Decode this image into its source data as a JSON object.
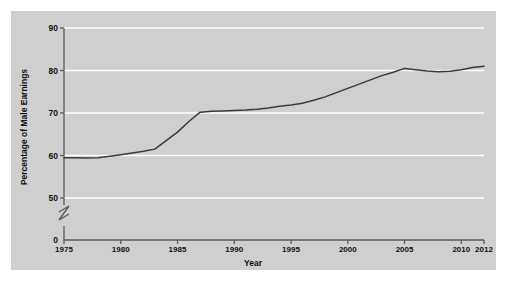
{
  "chart_data": {
    "type": "line",
    "title": "",
    "xlabel": "Year",
    "ylabel": "Percentage of Male Earnings",
    "xlim": [
      1975,
      2012
    ],
    "ylim": [
      50,
      90
    ],
    "y_axis_break": true,
    "y_axis_break_note": "axis broken between 0 and 50",
    "ytick_labels": [
      "0",
      "50",
      "60",
      "70",
      "80",
      "90"
    ],
    "ytick_values": [
      0,
      50,
      60,
      70,
      80,
      90
    ],
    "xtick_labels": [
      "1975",
      "1980",
      "1985",
      "1990",
      "1995",
      "2000",
      "2005",
      "2010",
      "2012"
    ],
    "xtick_values": [
      1975,
      1980,
      1985,
      1990,
      1995,
      2000,
      2005,
      2010,
      2012
    ],
    "grid": "horizontal",
    "legend": "none",
    "line_color": "#3a3a3a",
    "panel_color": "#cfcfcf",
    "gridline_color": "#ffffff",
    "x": [
      1975,
      1976,
      1977,
      1978,
      1979,
      1980,
      1981,
      1982,
      1983,
      1984,
      1985,
      1986,
      1987,
      1988,
      1989,
      1990,
      1991,
      1992,
      1993,
      1994,
      1995,
      1996,
      1997,
      1998,
      1999,
      2000,
      2001,
      2002,
      2003,
      2004,
      2005,
      2006,
      2007,
      2008,
      2009,
      2010,
      2011,
      2012
    ],
    "values": [
      59.5,
      59.5,
      59.4,
      59.5,
      59.8,
      60.2,
      60.6,
      61.0,
      61.5,
      63.5,
      65.5,
      68.0,
      70.2,
      70.4,
      70.5,
      70.6,
      70.7,
      70.9,
      71.2,
      71.6,
      71.9,
      72.3,
      73.0,
      73.8,
      74.8,
      75.8,
      76.8,
      77.8,
      78.8,
      79.6,
      80.5,
      80.2,
      79.9,
      79.7,
      79.8,
      80.2,
      80.7,
      81.0
    ],
    "series_name": "Women's earnings as percentage of male earnings"
  },
  "figure": {
    "background": "#ffffff"
  }
}
